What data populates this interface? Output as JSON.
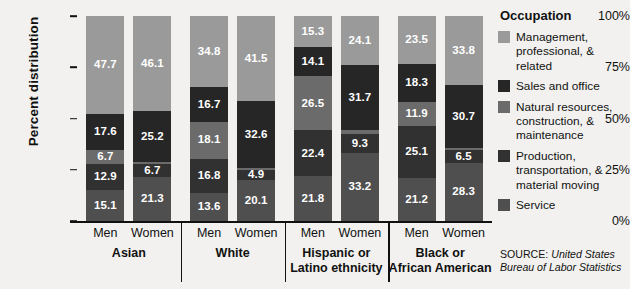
{
  "chart_data": {
    "type": "bar",
    "subtype": "stacked-percent",
    "title": "",
    "xlabel": "",
    "ylabel": "Percent distribution",
    "ylim": [
      0,
      100
    ],
    "ytick_labels": [
      "0%",
      "25%",
      "50%",
      "75%",
      "100%"
    ],
    "ytick_values": [
      0,
      25,
      50,
      75,
      100
    ],
    "grid": false,
    "legend_position": "right",
    "legend_title": "Occupation",
    "stack_order_bottom_to_top": [
      "Service",
      "Production, transportation, & material moving",
      "Natural resources, construction, & maintenance",
      "Sales and office",
      "Management, professional, & related"
    ],
    "series": [
      {
        "name": "Management, professional, & related",
        "color": "#9a9a9a",
        "values": [
          47.7,
          46.1,
          34.8,
          41.5,
          15.3,
          24.1,
          23.5,
          33.8
        ]
      },
      {
        "name": "Sales and office",
        "color": "#262626",
        "values": [
          17.6,
          25.2,
          16.7,
          32.6,
          14.1,
          31.7,
          18.3,
          30.7
        ]
      },
      {
        "name": "Natural resources, construction, & maintenance",
        "color": "#6b6b6b",
        "values": [
          6.7,
          0.7,
          18.1,
          0.9,
          26.5,
          1.7,
          11.9,
          0.7
        ]
      },
      {
        "name": "Production, transportation, & material moving",
        "color": "#313131",
        "values": [
          12.9,
          6.7,
          16.8,
          4.9,
          22.4,
          9.3,
          25.1,
          6.5
        ]
      },
      {
        "name": "Service",
        "color": "#4f4f4f",
        "values": [
          15.1,
          21.3,
          13.6,
          20.1,
          21.8,
          33.2,
          21.2,
          28.3
        ]
      }
    ],
    "categories": [
      {
        "group": "Asian",
        "gender": "Men"
      },
      {
        "group": "Asian",
        "gender": "Women"
      },
      {
        "group": "White",
        "gender": "Men"
      },
      {
        "group": "White",
        "gender": "Women"
      },
      {
        "group": "Hispanic or Latino ethnicity",
        "gender": "Men"
      },
      {
        "group": "Hispanic or Latino ethnicity",
        "gender": "Women"
      },
      {
        "group": "Black or African American",
        "gender": "Men"
      },
      {
        "group": "Black or African American",
        "gender": "Women"
      }
    ],
    "groups": [
      {
        "label_line1": "Asian",
        "label_line2": ""
      },
      {
        "label_line1": "White",
        "label_line2": ""
      },
      {
        "label_line1": "Hispanic or",
        "label_line2": "Latino ethnicity"
      },
      {
        "label_line1": "Black or",
        "label_line2": "African American"
      }
    ],
    "bar_labels": [
      [
        "47.7",
        "17.6",
        "6.7",
        "12.9",
        "15.1"
      ],
      [
        "46.1",
        "25.2",
        "",
        "6.7",
        "21.3"
      ],
      [
        "34.8",
        "16.7",
        "18.1",
        "16.8",
        "13.6"
      ],
      [
        "41.5",
        "32.6",
        "",
        "4.9",
        "20.1"
      ],
      [
        "15.3",
        "14.1",
        "26.5",
        "22.4",
        "21.8"
      ],
      [
        "24.1",
        "31.7",
        "",
        "9.3",
        "33.2"
      ],
      [
        "23.5",
        "18.3",
        "11.9",
        "25.1",
        "21.2"
      ],
      [
        "33.8",
        "30.7",
        "",
        "6.5",
        "28.3"
      ]
    ]
  },
  "legend": {
    "title": "Occupation",
    "items": [
      {
        "label": "Management, professional, & related",
        "color": "#9a9a9a"
      },
      {
        "label": "Sales and office",
        "color": "#262626"
      },
      {
        "label": "Natural resources, construction, & maintenance",
        "color": "#6b6b6b"
      },
      {
        "label": "Production, transportation, & material moving",
        "color": "#313131"
      },
      {
        "label": "Service",
        "color": "#4f4f4f"
      }
    ]
  },
  "source": {
    "prefix": "SOURCE:",
    "text": "United States Bureau of Labor Statistics"
  },
  "axis": {
    "y_title": "Percent distribution",
    "y_ticks": [
      "100%",
      "75%",
      "50%",
      "25%",
      "0%"
    ]
  }
}
